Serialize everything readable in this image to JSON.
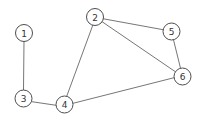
{
  "figure": {
    "name": "undirected-graph",
    "width": 202,
    "height": 121,
    "background_color": "#ffffff",
    "edge_color": "#666666",
    "node_fill_color": "#ffffff",
    "node_stroke_color": "#4d4d4d",
    "node_label_color": "#333333",
    "node_radius": 8.5
  },
  "chart_data": {
    "type": "diagram",
    "title": "",
    "xlabel": "",
    "ylabel": "",
    "graph_type": "undirected",
    "node_count": 6,
    "edge_count": 7,
    "nodes": [
      {
        "id": "1",
        "label": "1",
        "x": 24.0,
        "y": 33.0
      },
      {
        "id": "2",
        "label": "2",
        "x": 95.0,
        "y": 17.0
      },
      {
        "id": "3",
        "label": "3",
        "x": 23.5,
        "y": 98.5
      },
      {
        "id": "4",
        "label": "4",
        "x": 64.5,
        "y": 104.5
      },
      {
        "id": "5",
        "label": "5",
        "x": 171.5,
        "y": 31.5
      },
      {
        "id": "6",
        "label": "6",
        "x": 182.5,
        "y": 76.5
      }
    ],
    "edges": [
      {
        "source": "1",
        "target": "3",
        "x1": 24.0,
        "y1": 41.5,
        "x2": 23.5,
        "y2": 90.0
      },
      {
        "source": "3",
        "target": "4",
        "x1": 31.9,
        "y1": 101.7,
        "x2": 56.1,
        "y2": 105.3
      },
      {
        "source": "2",
        "target": "4",
        "x1": 92.8,
        "y1": 25.2,
        "x2": 66.7,
        "y2": 96.3
      },
      {
        "source": "2",
        "target": "5",
        "x1": 103.4,
        "y1": 18.8,
        "x2": 163.1,
        "y2": 29.7
      },
      {
        "source": "2",
        "target": "6",
        "x1": 102.2,
        "y1": 21.8,
        "x2": 175.3,
        "y2": 71.7
      },
      {
        "source": "5",
        "target": "6",
        "x1": 173.5,
        "y1": 39.8,
        "x2": 180.5,
        "y2": 68.2
      },
      {
        "source": "4",
        "target": "6",
        "x1": 73.0,
        "y1": 103.3,
        "x2": 174.1,
        "y2": 77.7
      }
    ]
  }
}
